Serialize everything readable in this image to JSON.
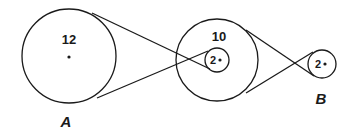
{
  "diagram": {
    "title": "",
    "stroke_color": "#1a1a1a",
    "pulleys": [
      {
        "id": "A-pulley",
        "label": "12",
        "cx": 69,
        "cy": 56,
        "r": 47
      },
      {
        "id": "large-compound-pulley",
        "label": "10",
        "cx": 217,
        "cy": 60,
        "r": 41
      },
      {
        "id": "small-compound-pulley",
        "label": "2",
        "cx": 217,
        "cy": 60,
        "r": 12
      },
      {
        "id": "B-pulley",
        "label": "2",
        "cx": 322,
        "cy": 64,
        "r": 14
      }
    ],
    "shaft_labels": {
      "a": "A",
      "b": "B"
    },
    "belts": [
      {
        "name": "crossed-belt-A-to-compound",
        "lines": [
          [
            92,
            13,
            210,
            69
          ],
          [
            97,
            98,
            208,
            51
          ]
        ]
      },
      {
        "name": "crossed-belt-compound-to-B",
        "lines": [
          [
            246,
            30,
            314,
            76
          ],
          [
            246,
            93,
            313,
            52
          ]
        ]
      }
    ]
  }
}
